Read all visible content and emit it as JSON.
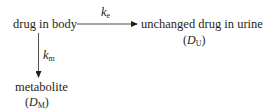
{
  "diagram": {
    "type": "pharmacokinetic-elimination-scheme",
    "nodes": {
      "body": {
        "label": "drug in body"
      },
      "urine": {
        "label": "unchanged drug in urine",
        "symbol": "D",
        "symbol_sub": "U"
      },
      "metabolite": {
        "label": "metabolite",
        "symbol": "D",
        "symbol_sub": "M"
      }
    },
    "edges": {
      "excretion": {
        "from": "drug in body",
        "to": "unchanged drug in urine",
        "rate": "k",
        "rate_sub": "e"
      },
      "metabolism": {
        "from": "drug in body",
        "to": "metabolite",
        "rate": "k",
        "rate_sub": "m"
      }
    },
    "paren_open": "(",
    "paren_close": ")"
  }
}
